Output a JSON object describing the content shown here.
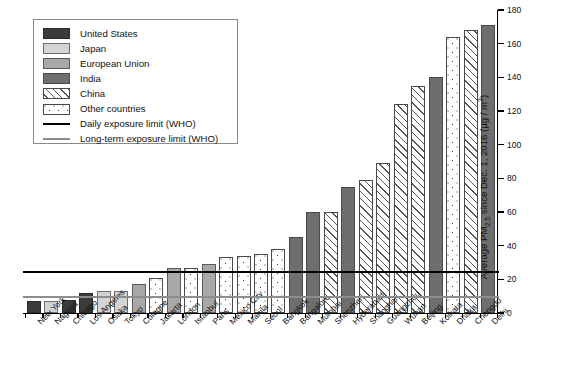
{
  "chart_data": {
    "type": "bar",
    "title": "",
    "subtitle": "",
    "xlabel": "",
    "ylabel": "Average PM2.5 since Dec. 1, 2016 (µg / m³)",
    "ylabel_parts": {
      "prefix": "Average PM",
      "sub": "2.5",
      "middle": " since Dec. 1, 2016 (µg / m",
      "sup": "3",
      "suffix": ")"
    },
    "ylim": [
      0,
      180
    ],
    "yticks": [
      0,
      20,
      40,
      60,
      80,
      100,
      120,
      140,
      160,
      180
    ],
    "grid": false,
    "legend_position": "top-left",
    "categories": [
      "New York",
      "Nagoya",
      "Chicago",
      "Los Angeles",
      "Osaka",
      "Tokyo",
      "Cologne",
      "Jakarta",
      "London",
      "Istanbul",
      "Paris",
      "Mexico City",
      "Manila",
      "Seoul",
      "Bangkok",
      "Bangalore",
      "Mumbai",
      "Shenzhen",
      "Hyderabad",
      "Shanghai",
      "Guangzhou",
      "Wuhan",
      "Beijing",
      "Kolkata",
      "Dhaka",
      "Chengdu",
      "Delhi"
    ],
    "values": [
      7,
      7,
      8,
      12,
      13,
      13,
      17,
      21,
      27,
      27,
      29,
      33,
      34,
      35,
      38,
      45,
      60,
      60,
      75,
      79,
      89,
      124,
      135,
      140,
      164,
      168,
      171
    ],
    "groups": [
      "us",
      "jp",
      "us",
      "us",
      "jp",
      "jp",
      "eu",
      "ot",
      "eu",
      "ot",
      "eu",
      "ot",
      "ot",
      "ot",
      "ot",
      "in",
      "in",
      "cn",
      "in",
      "cn",
      "cn",
      "cn",
      "cn",
      "in",
      "ot",
      "cn",
      "in"
    ],
    "reference_lines": [
      {
        "key": "daily",
        "label": "Daily exposure limit (WHO)",
        "value": 25,
        "color": "#000000"
      },
      {
        "key": "longterm",
        "label": "Long-term exposure limit (WHO)",
        "value": 10,
        "color": "#8d8d8d"
      }
    ],
    "legend": [
      {
        "key": "us",
        "label": "United States",
        "type": "swatch",
        "color": "#3b3b3b"
      },
      {
        "key": "jp",
        "label": "Japan",
        "type": "swatch",
        "color": "#d4d4d4"
      },
      {
        "key": "eu",
        "label": "European Union",
        "type": "swatch",
        "color": "#a8a8a8"
      },
      {
        "key": "in",
        "label": "India",
        "type": "swatch",
        "color": "#6e6e6e"
      },
      {
        "key": "cn",
        "label": "China",
        "type": "hatch",
        "color": "#ffffff"
      },
      {
        "key": "ot",
        "label": "Other countries",
        "type": "dots",
        "color": "#ffffff"
      },
      {
        "key": "daily",
        "label": "Daily exposure limit (WHO)",
        "type": "line",
        "color": "#000000"
      },
      {
        "key": "longterm",
        "label": "Long-term exposure limit (WHO)",
        "type": "line",
        "color": "#8d8d8d"
      }
    ]
  }
}
